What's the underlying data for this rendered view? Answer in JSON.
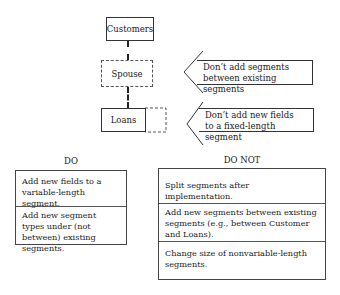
{
  "diagram": {
    "segments": {
      "customers": "Customers",
      "spouse": "Spouse",
      "loans": "Loans"
    },
    "notes": [
      {
        "line1": "Don’t add segments",
        "line2": "between existing segments"
      },
      {
        "line1": "Don’t add new fields",
        "line2": "to a fixed-length segment"
      }
    ]
  },
  "do": {
    "heading": "DO",
    "rows": [
      "Add new fields to a variable-length segment.",
      "Add new segment types under (not between) existing segments."
    ]
  },
  "do_not": {
    "heading": "DO NOT",
    "rows": [
      "Split segments after implementation.",
      "Add new segments between existing segments (e.g., between Customer and Loans).",
      "Change size of nonvariable-length segments."
    ]
  }
}
